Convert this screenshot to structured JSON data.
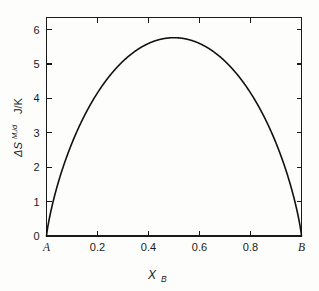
{
  "chart_data": {
    "type": "line",
    "title": "",
    "xlabel": "X_B",
    "ylabel": "ΔS M,id  J/K",
    "xlim": [
      0,
      1
    ],
    "ylim": [
      0,
      6.35
    ],
    "grid": false,
    "legend": "none",
    "series": [
      {
        "name": "Ideal molar entropy of mixing",
        "formula": "-R*(x*ln(x) + (1-x)*ln(1-x))",
        "x": [
          0,
          0.01,
          0.02,
          0.03,
          0.05,
          0.07,
          0.1,
          0.13,
          0.16,
          0.2,
          0.25,
          0.3,
          0.35,
          0.4,
          0.45,
          0.5,
          0.55,
          0.6,
          0.65,
          0.7,
          0.75,
          0.8,
          0.84,
          0.87,
          0.9,
          0.93,
          0.95,
          0.97,
          0.98,
          0.99,
          1
        ],
        "y": [
          0,
          0.466,
          0.81,
          1.107,
          1.647,
          2.108,
          2.703,
          3.208,
          3.634,
          4.159,
          4.676,
          5.08,
          5.376,
          5.585,
          5.718,
          5.763,
          5.718,
          5.585,
          5.376,
          5.08,
          4.676,
          4.159,
          3.634,
          3.208,
          2.703,
          2.108,
          1.647,
          1.107,
          0.81,
          0.466,
          0
        ]
      }
    ],
    "peak": {
      "x": 0.5,
      "y": 5.763
    },
    "yticks": [
      0,
      1,
      2,
      3,
      4,
      5,
      6
    ],
    "ytick_labels": [
      "0",
      "1",
      "2",
      "3",
      "4",
      "5",
      "6"
    ],
    "xticks": [
      0,
      0.2,
      0.4,
      0.6,
      0.8,
      1
    ],
    "xtick_labels": [
      "A",
      "0.2",
      "0.4",
      "0.6",
      "0.8",
      "B"
    ],
    "axis_label_parts": {
      "delta_s": "ΔS",
      "superscript": "M,id",
      "unit": "J/K",
      "x_symbol": "X",
      "x_subscript": "B"
    },
    "colors": {
      "curve": "#111111",
      "axis": "#1a1a1a",
      "background": "#fdfdfc",
      "text": "#1a1a1a"
    }
  }
}
